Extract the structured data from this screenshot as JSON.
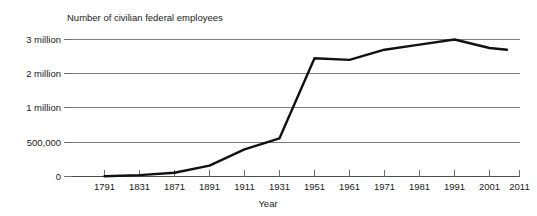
{
  "chart_data": {
    "type": "line",
    "title": "Number of civilian federal employees",
    "xlabel": "Year",
    "ylabel": "",
    "grid": true,
    "legend": false,
    "legend_position": "none",
    "line_color": "#111111",
    "grid_color": "#7d7d7d",
    "axis_color": "#4a4a4a",
    "note": "Y axis uses a compressed/non-linear scale: gridlines are evenly spaced in pixels but represent 0, 500,000, 1 million, 2 million, 3 million.",
    "y_ticks": [
      {
        "label": "3 million",
        "value": 3000000,
        "pos": 0
      },
      {
        "label": "2 million",
        "value": 2000000,
        "pos": 1
      },
      {
        "label": "1 million",
        "value": 1000000,
        "pos": 2
      },
      {
        "label": "500,000",
        "value": 500000,
        "pos": 3
      },
      {
        "label": "0",
        "value": 0,
        "pos": 4
      }
    ],
    "x_ticks": [
      "1791",
      "1831",
      "1871",
      "1891",
      "1911",
      "1931",
      "1951",
      "1961",
      "1971",
      "1981",
      "1991",
      "2001",
      "2011"
    ],
    "categories": [
      "1791",
      "1831",
      "1871",
      "1891",
      "1911",
      "1931",
      "1951",
      "1961",
      "1971",
      "1981",
      "1991",
      "2001",
      "2006"
    ],
    "values": [
      5000,
      20000,
      55000,
      160000,
      400000,
      560000,
      2450000,
      2400000,
      2700000,
      2850000,
      3000000,
      2750000,
      2700000
    ],
    "ylim": [
      0,
      3000000
    ],
    "xlim": [
      "1791",
      "2011"
    ]
  }
}
